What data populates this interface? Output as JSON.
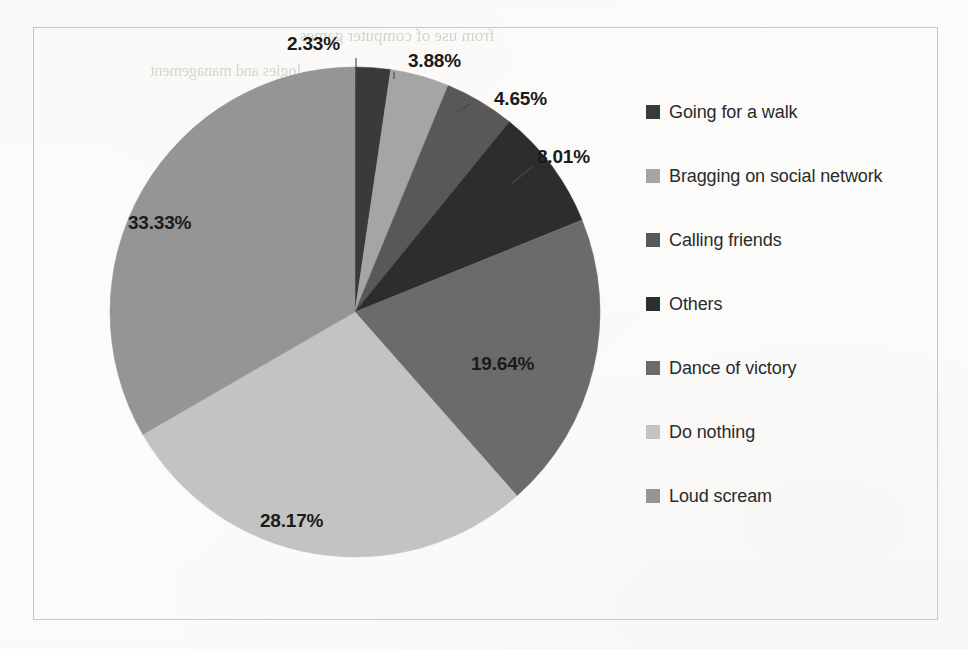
{
  "chart_data": {
    "type": "pie",
    "title": "",
    "subtitle": "",
    "xlabel": "",
    "ylabel": "",
    "grid": false,
    "legend_position": "right",
    "units": "percent",
    "start_angle_deg": 0,
    "direction": "clockwise",
    "categories": [
      "Going for a walk",
      "Bragging on social network",
      "Calling friends",
      "Others",
      "Dance of victory",
      "Do nothing",
      "Loud scream"
    ],
    "values": [
      2.33,
      3.88,
      4.65,
      8.01,
      19.64,
      28.17,
      33.33
    ],
    "value_labels": [
      "2.33%",
      "3.88%",
      "4.65%",
      "8.01%",
      "19.64%",
      "28.17%",
      "33.33%"
    ],
    "colors": [
      "#3a3a3a",
      "#a5a5a5",
      "#585858",
      "#2d2d2d",
      "#6b6b6b",
      "#c3c3c3",
      "#959595"
    ],
    "label_placement": [
      "outside",
      "outside",
      "outside",
      "outside",
      "inside",
      "inside",
      "inside"
    ],
    "slices": [
      {
        "name": "Going for a walk",
        "value": 2.33,
        "label": "2.33%",
        "color": "#3a3a3a"
      },
      {
        "name": "Bragging on social network",
        "value": 3.88,
        "label": "3.88%",
        "color": "#a5a5a5"
      },
      {
        "name": "Calling friends",
        "value": 4.65,
        "label": "4.65%",
        "color": "#585858"
      },
      {
        "name": "Others",
        "value": 8.01,
        "label": "8.01%",
        "color": "#2d2d2d"
      },
      {
        "name": "Dance of victory",
        "value": 19.64,
        "label": "19.64%",
        "color": "#6b6b6b"
      },
      {
        "name": "Do nothing",
        "value": 28.17,
        "label": "28.17%",
        "color": "#c3c3c3"
      },
      {
        "name": "Loud scream",
        "value": 33.33,
        "label": "33.33%",
        "color": "#959595"
      }
    ]
  },
  "labels": {
    "walk": "2.33%",
    "bragging": "3.88%",
    "calling": "4.65%",
    "others": "8.01%",
    "dance": "19.64%",
    "donothing": "28.17%",
    "scream": "33.33%"
  },
  "legend": {
    "items": [
      {
        "label": "Going for a walk",
        "color": "#3a3a3a"
      },
      {
        "label": "Bragging on social network",
        "color": "#a5a5a5"
      },
      {
        "label": "Calling friends",
        "color": "#585858"
      },
      {
        "label": "Others",
        "color": "#2d2d2d"
      },
      {
        "label": "Dance of victory",
        "color": "#6b6b6b"
      },
      {
        "label": "Do nothing",
        "color": "#c3c3c3"
      },
      {
        "label": "Loud scream",
        "color": "#959595"
      }
    ]
  },
  "page_background": {
    "bleed_through": [
      {
        "text": "from use of computer games",
        "x": 300,
        "y": 26,
        "size": 17
      },
      {
        "text": "logies and management",
        "x": 150,
        "y": 62,
        "size": 16
      },
      {
        "text": "tanding, impro",
        "x": 330,
        "y": 108,
        "size": 16
      },
      {
        "text": "ning, inform",
        "x": 360,
        "y": 140,
        "size": 16
      },
      {
        "text": "rning purposes",
        "x": 300,
        "y": 258,
        "size": 15
      },
      {
        "text": "nagement",
        "x": 250,
        "y": 292,
        "size": 15
      }
    ]
  },
  "frame": {
    "border_color": "#c9c7c2"
  }
}
